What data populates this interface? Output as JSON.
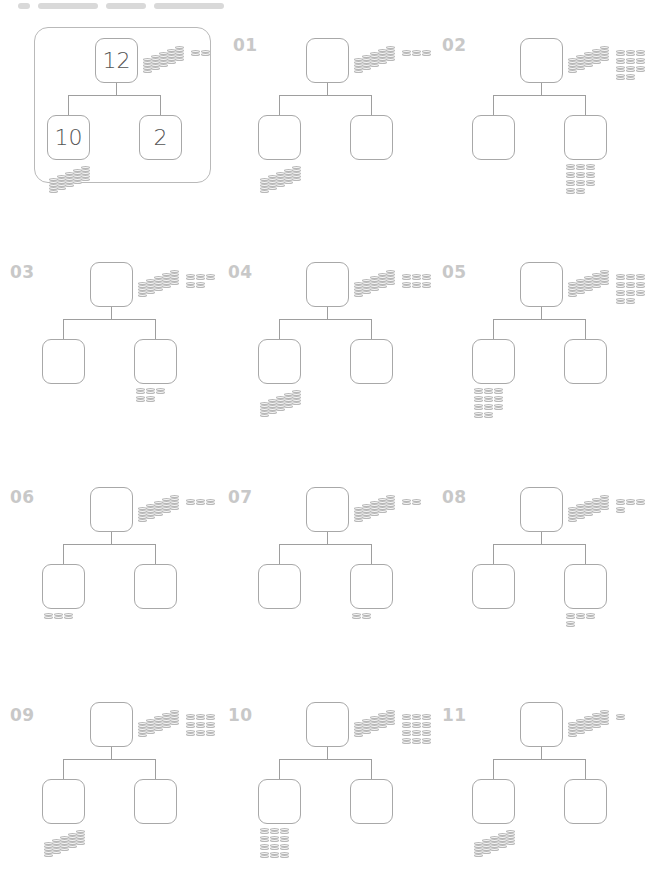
{
  "worksheet": {
    "type": "number-bond-coins",
    "example": {
      "whole": "12",
      "left": "10",
      "right": "2",
      "whole_coins": {
        "tens": 1,
        "ones": 2
      },
      "left_coins": {
        "tens": 1,
        "ones": 0
      }
    },
    "problems": [
      {
        "label": "01",
        "whole_coins": {
          "tens": 1,
          "ones": 3
        },
        "hint_side": "left",
        "hint_coins": {
          "tens": 1,
          "ones": 0
        }
      },
      {
        "label": "02",
        "whole_coins": {
          "tens": 1,
          "ones": 11
        },
        "hint_side": "right",
        "hint_coins": {
          "tens": 0,
          "ones": 11
        }
      },
      {
        "label": "03",
        "whole_coins": {
          "tens": 1,
          "ones": 5
        },
        "hint_side": "right",
        "hint_coins": {
          "tens": 0,
          "ones": 5
        }
      },
      {
        "label": "04",
        "whole_coins": {
          "tens": 1,
          "ones": 6
        },
        "hint_side": "left",
        "hint_coins": {
          "tens": 1,
          "ones": 0
        }
      },
      {
        "label": "05",
        "whole_coins": {
          "tens": 1,
          "ones": 11
        },
        "hint_side": "left",
        "hint_coins": {
          "tens": 0,
          "ones": 11
        }
      },
      {
        "label": "06",
        "whole_coins": {
          "tens": 1,
          "ones": 3
        },
        "hint_side": "left",
        "hint_coins": {
          "tens": 0,
          "ones": 3
        }
      },
      {
        "label": "07",
        "whole_coins": {
          "tens": 1,
          "ones": 2
        },
        "hint_side": "right",
        "hint_coins": {
          "tens": 0,
          "ones": 2
        }
      },
      {
        "label": "08",
        "whole_coins": {
          "tens": 1,
          "ones": 4
        },
        "hint_side": "right",
        "hint_coins": {
          "tens": 0,
          "ones": 4
        }
      },
      {
        "label": "09",
        "whole_coins": {
          "tens": 1,
          "ones": 9
        },
        "hint_side": "left",
        "hint_coins": {
          "tens": 1,
          "ones": 0
        }
      },
      {
        "label": "10",
        "whole_coins": {
          "tens": 1,
          "ones": 12
        },
        "hint_side": "left",
        "hint_coins": {
          "tens": 0,
          "ones": 12
        }
      },
      {
        "label": "11",
        "whole_coins": {
          "tens": 1,
          "ones": 1
        },
        "hint_side": "left",
        "hint_coins": {
          "tens": 1,
          "ones": 0
        }
      }
    ]
  },
  "colors": {
    "label": "#c8c8c8",
    "box_border": "#a8a8a8",
    "line": "#9e9e9e",
    "coin": "#b8b8b8"
  }
}
